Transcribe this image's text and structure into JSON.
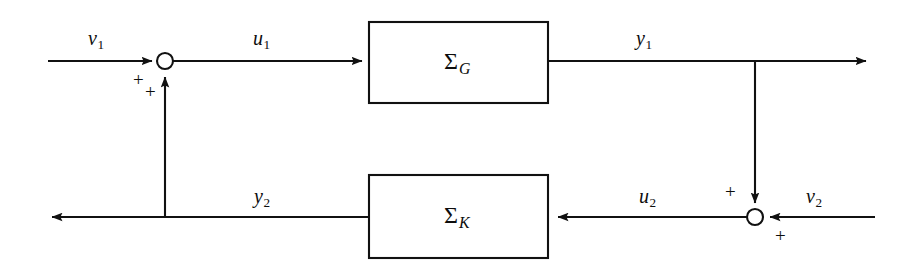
{
  "diagram": {
    "type": "control-block-diagram",
    "stroke_color": "#111111",
    "background_color": "#ffffff",
    "blocks": [
      {
        "id": "plant",
        "label_main": "Σ",
        "label_sub": "G",
        "x": 369,
        "y": 22,
        "width": 179,
        "height": 81
      },
      {
        "id": "controller",
        "label_main": "Σ",
        "label_sub": "K",
        "x": 369,
        "y": 175,
        "width": 179,
        "height": 83
      }
    ],
    "junctions": [
      {
        "id": "sum-top-left",
        "cx": 165,
        "cy": 61,
        "r": 8
      },
      {
        "id": "sum-bottom-right",
        "cx": 755,
        "cy": 217,
        "r": 8
      }
    ],
    "signals": [
      {
        "id": "v1",
        "base": "v",
        "sub": "1",
        "x": 88,
        "y": 28
      },
      {
        "id": "u1",
        "base": "u",
        "sub": "1",
        "x": 253,
        "y": 28
      },
      {
        "id": "y1",
        "base": "y",
        "sub": "1",
        "x": 636,
        "y": 28
      },
      {
        "id": "y2",
        "base": "y",
        "sub": "2",
        "x": 254,
        "y": 186
      },
      {
        "id": "u2",
        "base": "u",
        "sub": "2",
        "x": 639,
        "y": 186
      },
      {
        "id": "v2",
        "base": "v",
        "sub": "2",
        "x": 806,
        "y": 186
      }
    ],
    "signs": [
      {
        "id": "sign-top-left-horizontal",
        "text": "+",
        "x": 133,
        "y": 70
      },
      {
        "id": "sign-top-left-vertical",
        "text": "+",
        "x": 145,
        "y": 82
      },
      {
        "id": "sign-bottom-right-vertical",
        "text": "+",
        "x": 725,
        "y": 182
      },
      {
        "id": "sign-bottom-right-horizontal",
        "text": "+",
        "x": 775,
        "y": 226
      }
    ]
  }
}
